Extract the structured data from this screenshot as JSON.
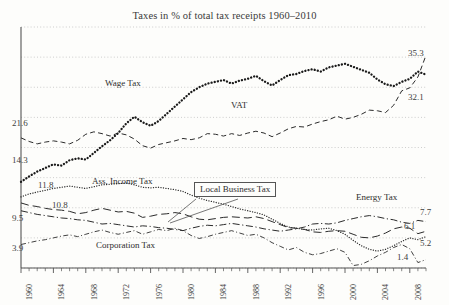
{
  "chart_data": {
    "type": "line",
    "title": "Taxes in % of total tax receipts 1960–2010",
    "xlabel": "",
    "ylabel": "",
    "xlim": [
      1960,
      2010
    ],
    "ylim": [
      0,
      40
    ],
    "grid": true,
    "legend_position": "inline-labels",
    "x_tick_labels": [
      "1960",
      "1964",
      "1968",
      "1972",
      "1976",
      "1980",
      "1984",
      "1988",
      "1992",
      "1996",
      "2000",
      "2004",
      "2008"
    ],
    "x_tick_step_minor": 1,
    "start_value_labels": [
      "21.6",
      "14.3",
      "11.8",
      "10.8",
      "9.5",
      "3.9"
    ],
    "end_value_labels": [
      "35.3",
      "32.1",
      "7.7",
      "6.1",
      "5.2",
      "1.4"
    ],
    "series": [
      {
        "name": "VAT",
        "label": "VAT",
        "style": "dashed",
        "start_label": "21.6",
        "end_label": "35.3",
        "values": [
          21.6,
          21.0,
          20.6,
          20.9,
          21.1,
          20.9,
          20.6,
          21.2,
          22.2,
          22.6,
          22.3,
          21.9,
          22.4,
          22.1,
          21.4,
          20.3,
          19.9,
          20.5,
          20.8,
          21.1,
          21.5,
          21.3,
          21.6,
          22.3,
          22.2,
          21.9,
          22.3,
          22.0,
          22.4,
          22.7,
          22.4,
          21.8,
          22.4,
          23.1,
          23.5,
          23.4,
          23.9,
          24.3,
          24.6,
          25.2,
          24.7,
          25.0,
          25.5,
          26.2,
          26.1,
          25.8,
          27.0,
          29.4,
          29.9,
          31.7,
          35.3
        ]
      },
      {
        "name": "Wage Tax",
        "label": "Wage Tax",
        "style": "dotted-bold",
        "start_label": "14.3",
        "end_label": "32.1",
        "values": [
          14.3,
          15.2,
          16.0,
          16.6,
          17.2,
          17.0,
          17.9,
          18.2,
          18.0,
          19.1,
          20.2,
          21.2,
          22.4,
          24.0,
          25.1,
          24.2,
          23.6,
          24.4,
          25.6,
          26.8,
          28.0,
          29.2,
          30.0,
          30.6,
          30.9,
          31.2,
          30.6,
          31.1,
          31.4,
          31.9,
          31.0,
          30.3,
          31.2,
          32.0,
          32.2,
          32.7,
          33.0,
          32.6,
          33.3,
          33.6,
          33.9,
          33.4,
          32.9,
          32.4,
          31.3,
          30.5,
          30.2,
          30.9,
          31.4,
          32.6,
          32.1
        ]
      },
      {
        "name": "Ass. Income Tax",
        "label": "Ass. Income Tax",
        "style": "dotted-fine",
        "start_label": "11.8",
        "end_label": "5.2",
        "values": [
          11.8,
          12.3,
          12.6,
          12.9,
          13.2,
          13.4,
          13.6,
          13.4,
          13.2,
          13.5,
          13.8,
          13.9,
          14.0,
          14.1,
          13.8,
          13.4,
          13.3,
          13.4,
          13.2,
          13.0,
          12.7,
          12.1,
          11.6,
          11.2,
          10.9,
          10.6,
          10.2,
          9.8,
          9.5,
          9.2,
          8.8,
          8.1,
          7.4,
          6.8,
          6.6,
          6.4,
          6.3,
          6.5,
          6.6,
          6.2,
          5.6,
          4.6,
          3.7,
          3.1,
          2.8,
          3.1,
          3.7,
          4.4,
          5.0,
          4.7,
          5.2
        ]
      },
      {
        "name": "Local Business Tax",
        "label": "Local Business Tax",
        "style": "long-dash",
        "start_label": "10.8",
        "end_label": "6.1",
        "values": [
          10.8,
          10.4,
          10.2,
          9.9,
          9.7,
          9.6,
          9.4,
          9.0,
          9.2,
          9.6,
          9.9,
          9.6,
          9.3,
          9.4,
          9.1,
          8.4,
          8.6,
          8.9,
          9.0,
          9.2,
          9.0,
          8.5,
          8.1,
          8.0,
          8.2,
          8.4,
          8.5,
          8.4,
          8.3,
          8.5,
          8.2,
          7.7,
          7.2,
          6.7,
          6.6,
          6.4,
          6.0,
          5.9,
          6.1,
          6.2,
          6.1,
          5.6,
          5.1,
          5.0,
          5.3,
          5.8,
          6.5,
          6.8,
          6.6,
          5.7,
          6.1
        ]
      },
      {
        "name": "Energy Tax",
        "label": "Energy Tax",
        "style": "dash-dot",
        "start_label": "9.5",
        "end_label": "7.7",
        "values": [
          9.5,
          9.2,
          8.9,
          8.7,
          8.5,
          8.3,
          8.2,
          8.0,
          7.9,
          7.6,
          7.3,
          7.4,
          7.2,
          7.0,
          6.8,
          7.0,
          6.9,
          6.7,
          6.6,
          6.4,
          6.2,
          6.6,
          6.9,
          7.1,
          7.0,
          7.2,
          7.4,
          7.2,
          7.0,
          6.8,
          6.5,
          6.3,
          6.1,
          6.3,
          6.5,
          6.8,
          7.3,
          7.4,
          7.3,
          7.5,
          7.9,
          8.2,
          8.5,
          8.7,
          8.5,
          8.2,
          8.0,
          7.6,
          7.4,
          7.9,
          7.7
        ]
      },
      {
        "name": "Corporation Tax",
        "label": "Corporation Tax",
        "style": "dash-dot-fine",
        "start_label": "3.9",
        "end_label": "1.4",
        "values": [
          3.9,
          4.2,
          4.5,
          4.7,
          5.0,
          5.3,
          5.5,
          5.2,
          5.6,
          6.0,
          6.3,
          5.9,
          5.6,
          5.9,
          6.2,
          5.6,
          6.0,
          6.4,
          6.2,
          6.6,
          6.2,
          5.4,
          4.9,
          5.2,
          5.6,
          5.9,
          6.2,
          5.8,
          5.4,
          5.6,
          5.0,
          4.2,
          3.6,
          3.0,
          3.4,
          2.6,
          2.2,
          2.4,
          2.8,
          3.2,
          2.6,
          0.4,
          0.6,
          1.2,
          2.0,
          2.6,
          3.4,
          3.9,
          3.2,
          0.9,
          1.4
        ]
      }
    ]
  }
}
